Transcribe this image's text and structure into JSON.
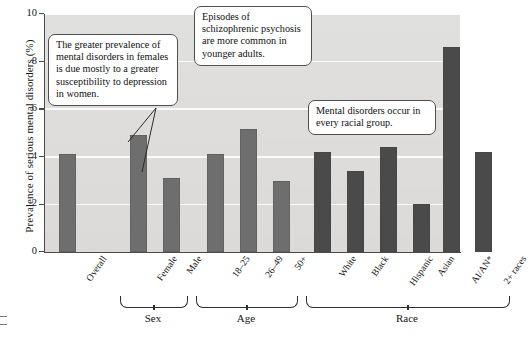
{
  "chart_data": {
    "type": "bar",
    "title": "",
    "xlabel": "",
    "ylabel": "Prevalence of serious mental disorders (%)",
    "ylim": [
      0,
      10
    ],
    "yticks": [
      0,
      2,
      4,
      6,
      8,
      10
    ],
    "grid": true,
    "legend": "none",
    "categories": [
      "Overall",
      "Female",
      "Male",
      "18–25",
      "26–49",
      "50+",
      "White",
      "Black",
      "Hispanic",
      "Asian",
      "AI/AN*",
      "2+ races"
    ],
    "values": [
      4.1,
      4.9,
      3.1,
      4.1,
      5.15,
      3.0,
      4.2,
      3.4,
      4.4,
      2.0,
      8.6,
      4.2
    ],
    "groups": [
      {
        "label": "",
        "categories": [
          "Overall"
        ]
      },
      {
        "label": "Sex",
        "categories": [
          "Female",
          "Male"
        ]
      },
      {
        "label": "Age",
        "categories": [
          "18–25",
          "26–49",
          "50+"
        ]
      },
      {
        "label": "Race",
        "categories": [
          "White",
          "Black",
          "Hispanic",
          "Asian",
          "AI/AN*",
          "2+ races"
        ]
      }
    ],
    "bar_colors": {
      "light": "#6e6e6e",
      "dark": "#4a4a4a"
    },
    "plot_background": "#dedddb"
  },
  "annotations": [
    {
      "id": "sex-note",
      "text": "The greater prevalence of mental disorders in females is due mostly to a greater susceptibility to depression in women."
    },
    {
      "id": "age-note",
      "text": "Episodes of schizophrenic psychosis are more common in younger adults."
    },
    {
      "id": "race-note",
      "text": "Mental disorders occur in every racial group."
    }
  ],
  "axis": {
    "y_title": "Prevalence of serious mental disorders (%)",
    "tick_0": "0",
    "tick_2": "2",
    "tick_4": "4",
    "tick_6": "6",
    "tick_8": "8",
    "tick_10": "10"
  },
  "group_labels": {
    "sex": "Sex",
    "age": "Age",
    "race": "Race"
  }
}
